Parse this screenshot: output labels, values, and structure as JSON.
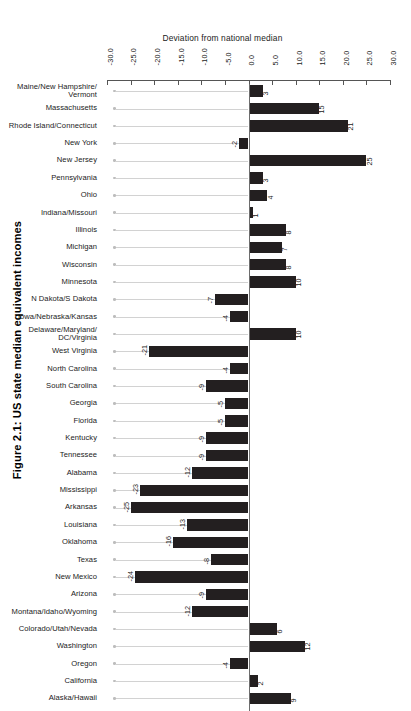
{
  "figure": {
    "title": "Figure 2.1: US state median equivalent incomes"
  },
  "chart_data": {
    "type": "bar",
    "orientation": "horizontal",
    "title": "Figure 2.1: US state median equivalent incomes",
    "xlabel": "Deviation from national median",
    "ylabel": "",
    "xlim": [
      -30.0,
      30.0
    ],
    "xticks": [
      "-30.0",
      "-25.0",
      "-20.0",
      "-15.0",
      "-10.0",
      "-5.0",
      "0.0",
      "5.0",
      "10.0",
      "15.0",
      "20.0",
      "25.0",
      "30.0"
    ],
    "xtick_values": [
      -30,
      -25,
      -20,
      -15,
      -10,
      -5,
      0,
      5,
      10,
      15,
      20,
      25,
      30
    ],
    "grid": false,
    "legend": null,
    "bar_color": "#231f20",
    "categories": [
      "Maine/New Hampshire/ Vermont",
      "Massachusetts",
      "Rhode Island/Connecticut",
      "New York",
      "New Jersey",
      "Pennsylvania",
      "Ohio",
      "Indiana/Missouri",
      "Illinois",
      "Michigan",
      "Wisconsin",
      "Minnesota",
      "N Dakota/S Dakota",
      "Iowa/Nebraska/Kansas",
      "Delaware/Maryland/ DC/Virginia",
      "West Virginia",
      "North Carolina",
      "South Carolina",
      "Georgia",
      "Florida",
      "Kentucky",
      "Tennessee",
      "Alabama",
      "Mississippi",
      "Arkansas",
      "Louisiana",
      "Oklahoma",
      "Texas",
      "New Mexico",
      "Arizona",
      "Montana/Idaho/Wyoming",
      "Colorado/Utah/Nevada",
      "Washington",
      "Oregon",
      "California",
      "Alaska/Hawaii"
    ],
    "values": [
      3,
      15,
      21,
      -2,
      25,
      3,
      4,
      1,
      8,
      7,
      8,
      10,
      -7,
      -4,
      10,
      -21,
      -4,
      -9,
      -5,
      -5,
      -9,
      -9,
      -12,
      -23,
      -25,
      -13,
      -16,
      -8,
      -24,
      -9,
      -12,
      6,
      12,
      -4,
      2,
      9
    ],
    "value_labels": [
      "3",
      "15",
      "21",
      "-2",
      "25",
      "3",
      "4",
      "1",
      "8",
      "7",
      "8",
      "10",
      "-7",
      "-4",
      "10",
      "-21",
      "-4",
      "-9",
      "-5",
      "-5",
      "-9",
      "-9",
      "-12",
      "-23",
      "-25",
      "-13",
      "-16",
      "-8",
      "-24",
      "-9",
      "-12",
      "6",
      "12",
      "-4",
      "2",
      "9"
    ],
    "rows": [
      {
        "label_line1": "Maine/New Hampshire/",
        "label_line2": "Vermont",
        "value": 3,
        "value_label": "3"
      },
      {
        "label_line1": "Massachusetts",
        "label_line2": "",
        "value": 15,
        "value_label": "15"
      },
      {
        "label_line1": "Rhode Island/Connecticut",
        "label_line2": "",
        "value": 21,
        "value_label": "21"
      },
      {
        "label_line1": "New York",
        "label_line2": "",
        "value": -2,
        "value_label": "-2"
      },
      {
        "label_line1": "New Jersey",
        "label_line2": "",
        "value": 25,
        "value_label": "25"
      },
      {
        "label_line1": "Pennsylvania",
        "label_line2": "",
        "value": 3,
        "value_label": "3"
      },
      {
        "label_line1": "Ohio",
        "label_line2": "",
        "value": 4,
        "value_label": "4"
      },
      {
        "label_line1": "Indiana/Missouri",
        "label_line2": "",
        "value": 1,
        "value_label": "1"
      },
      {
        "label_line1": "Illinois",
        "label_line2": "",
        "value": 8,
        "value_label": "8"
      },
      {
        "label_line1": "Michigan",
        "label_line2": "",
        "value": 7,
        "value_label": "7"
      },
      {
        "label_line1": "Wisconsin",
        "label_line2": "",
        "value": 8,
        "value_label": "8"
      },
      {
        "label_line1": "Minnesota",
        "label_line2": "",
        "value": 10,
        "value_label": "10"
      },
      {
        "label_line1": "N Dakota/S Dakota",
        "label_line2": "",
        "value": -7,
        "value_label": "-7"
      },
      {
        "label_line1": "Iowa/Nebraska/Kansas",
        "label_line2": "",
        "value": -4,
        "value_label": "-4"
      },
      {
        "label_line1": "Delaware/Maryland/",
        "label_line2": "DC/Virginia",
        "value": 10,
        "value_label": "10"
      },
      {
        "label_line1": "West Virginia",
        "label_line2": "",
        "value": -21,
        "value_label": "-21"
      },
      {
        "label_line1": "North Carolina",
        "label_line2": "",
        "value": -4,
        "value_label": "-4"
      },
      {
        "label_line1": "South Carolina",
        "label_line2": "",
        "value": -9,
        "value_label": "-9"
      },
      {
        "label_line1": "Georgia",
        "label_line2": "",
        "value": -5,
        "value_label": "-5"
      },
      {
        "label_line1": "Florida",
        "label_line2": "",
        "value": -5,
        "value_label": "-5"
      },
      {
        "label_line1": "Kentucky",
        "label_line2": "",
        "value": -9,
        "value_label": "-9"
      },
      {
        "label_line1": "Tennessee",
        "label_line2": "",
        "value": -9,
        "value_label": "-9"
      },
      {
        "label_line1": "Alabama",
        "label_line2": "",
        "value": -12,
        "value_label": "-12"
      },
      {
        "label_line1": "Mississippi",
        "label_line2": "",
        "value": -23,
        "value_label": "-23"
      },
      {
        "label_line1": "Arkansas",
        "label_line2": "",
        "value": -25,
        "value_label": "-25"
      },
      {
        "label_line1": "Louisiana",
        "label_line2": "",
        "value": -13,
        "value_label": "-13"
      },
      {
        "label_line1": "Oklahoma",
        "label_line2": "",
        "value": -16,
        "value_label": "-16"
      },
      {
        "label_line1": "Texas",
        "label_line2": "",
        "value": -8,
        "value_label": "-8"
      },
      {
        "label_line1": "New Mexico",
        "label_line2": "",
        "value": -24,
        "value_label": "-24"
      },
      {
        "label_line1": "Arizona",
        "label_line2": "",
        "value": -9,
        "value_label": "-9"
      },
      {
        "label_line1": "Montana/Idaho/Wyoming",
        "label_line2": "",
        "value": -12,
        "value_label": "-12"
      },
      {
        "label_line1": "Colorado/Utah/Nevada",
        "label_line2": "",
        "value": 6,
        "value_label": "6"
      },
      {
        "label_line1": "Washington",
        "label_line2": "",
        "value": 12,
        "value_label": "12"
      },
      {
        "label_line1": "Oregon",
        "label_line2": "",
        "value": -4,
        "value_label": "-4"
      },
      {
        "label_line1": "California",
        "label_line2": "",
        "value": 2,
        "value_label": "2"
      },
      {
        "label_line1": "Alaska/Hawaii",
        "label_line2": "",
        "value": 9,
        "value_label": "9"
      }
    ]
  }
}
